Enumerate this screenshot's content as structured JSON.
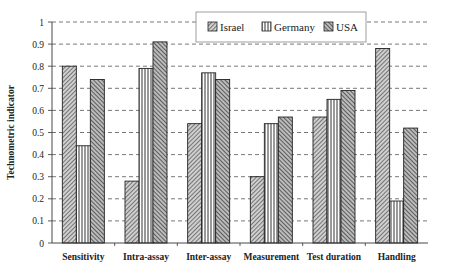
{
  "chart_data": {
    "type": "bar",
    "title": "",
    "xlabel": "",
    "ylabel": "Technometric indicator",
    "ylim": [
      0,
      1
    ],
    "yticks": [
      "0",
      "0.1",
      "0.2",
      "0.3",
      "0.4",
      "0.5",
      "0.6",
      "0.7",
      "0.8",
      "0.9",
      "1"
    ],
    "grid": true,
    "legend_position": "top-center",
    "categories": [
      "Sensitivity",
      "Intra-assay",
      "Inter-assay",
      "Measurement",
      "Test duration",
      "Handling"
    ],
    "series": [
      {
        "name": "Israel",
        "pattern": "diagonal-hatch",
        "values": [
          0.8,
          0.28,
          0.54,
          0.3,
          0.57,
          0.88
        ]
      },
      {
        "name": "Germany",
        "pattern": "vertical-stripes",
        "values": [
          0.44,
          0.79,
          0.77,
          0.54,
          0.65,
          0.19
        ]
      },
      {
        "name": "USA",
        "pattern": "dense-diagonal-hatch",
        "values": [
          0.74,
          0.91,
          0.74,
          0.57,
          0.69,
          0.52
        ]
      }
    ]
  }
}
